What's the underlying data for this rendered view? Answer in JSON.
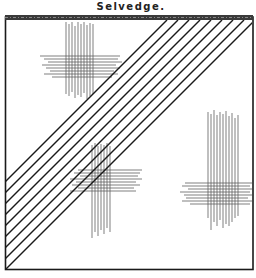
{
  "title": "Selvedge.",
  "diagram": {
    "colors": {
      "ink": "#1a1a1a",
      "thread": "#555555",
      "background": "#ffffff"
    },
    "frame": {
      "x": 5,
      "y": 16,
      "width": 248,
      "height": 254
    },
    "selvedge_bar": {
      "x": 5,
      "y": 15,
      "width": 248,
      "height": 6
    },
    "diagonal_lines": {
      "count": 9,
      "spacing": 11,
      "description": "parallel 45-degree bias lines from lower-left to upper-right"
    },
    "weave_patches": [
      {
        "name": "upper-left",
        "cx": 85,
        "cy": 65
      },
      {
        "name": "center",
        "cx": 105,
        "cy": 180
      },
      {
        "name": "right",
        "cx": 220,
        "cy": 185
      }
    ]
  }
}
